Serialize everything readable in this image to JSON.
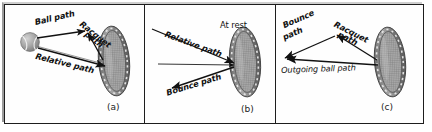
{
  "figure": {
    "background_color": "#ffffff",
    "frame_color": "#1d1d1d",
    "ink_color": "#111111",
    "racquet_gray": "#8a8a8a",
    "ball_gray": "#9a9a9a"
  },
  "panels": [
    {
      "letter": "(a)",
      "name": "incoming",
      "labels": [
        {
          "text": "Ball path",
          "name": "ball-path-label"
        },
        {
          "text": "Racquet",
          "name": "racquet-path-label-line1"
        },
        {
          "text": "path",
          "name": "racquet-path-label-line2"
        },
        {
          "text": "Relative path",
          "name": "relative-path-label"
        }
      ],
      "objects": [
        "tennis-ball",
        "racquet"
      ]
    },
    {
      "letter": "(b)",
      "name": "racquet-frame",
      "labels": [
        {
          "text": "At rest",
          "name": "at-rest-label"
        },
        {
          "text": "Relative path",
          "name": "relative-path-label"
        },
        {
          "text": "Bounce path",
          "name": "bounce-path-label"
        }
      ],
      "objects": [
        "racquet"
      ]
    },
    {
      "letter": "(c)",
      "name": "outgoing",
      "labels": [
        {
          "text": "Bounce",
          "name": "bounce-path-label-line1"
        },
        {
          "text": "path",
          "name": "bounce-path-label-line2"
        },
        {
          "text": "Racquet",
          "name": "racquet-path-label-line1"
        },
        {
          "text": "path",
          "name": "racquet-path-label-line2"
        },
        {
          "text": "Outgoing ball path",
          "name": "outgoing-ball-path-label"
        }
      ],
      "objects": [
        "racquet"
      ]
    }
  ]
}
